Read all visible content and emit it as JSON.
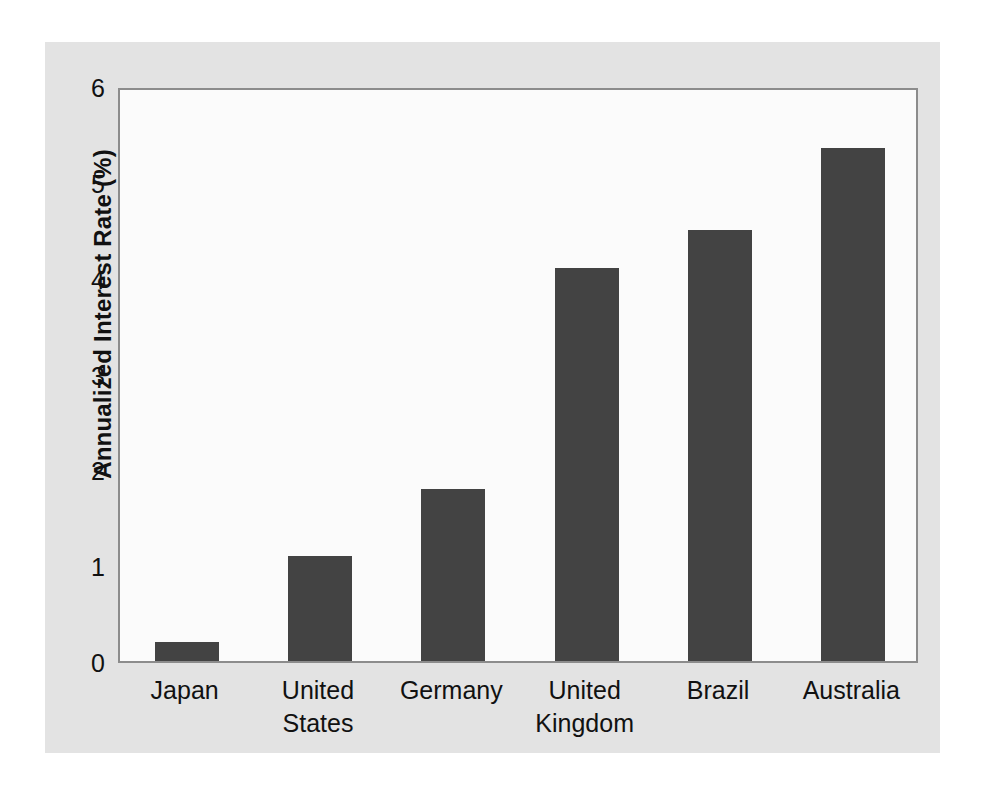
{
  "chart_data": {
    "type": "bar",
    "title": "",
    "subtitle": "",
    "xlabel": "",
    "ylabel": "Annualized Interest Rate (%)",
    "categories": [
      "Japan",
      "United States",
      "Germany",
      "United Kingdom",
      "Brazil",
      "Australia"
    ],
    "values": [
      0.2,
      1.1,
      1.8,
      4.1,
      4.5,
      5.35
    ],
    "ylim": [
      0,
      6
    ],
    "ytick_labels": [
      "0",
      "1",
      "2",
      "3",
      "4",
      "5",
      "6"
    ],
    "ytick_values": [
      0,
      1,
      2,
      3,
      4,
      5,
      6
    ],
    "grid": false,
    "legend": false,
    "legend_position": "none",
    "bar_color": "#434343",
    "plot_background": "#fbfbfb",
    "figure_background": "#e3e3e3",
    "axis_color": "#8c8c8c",
    "text_color": "#111111"
  },
  "axis": {
    "y_label": "Annualized Interest Rate (%)",
    "y_ticks": [
      "6",
      "5",
      "4",
      "3",
      "2",
      "1",
      "0"
    ],
    "x_categories": [
      {
        "label": "Japan",
        "lines": "Japan"
      },
      {
        "label": "United States",
        "lines": "United\nStates"
      },
      {
        "label": "Germany",
        "lines": "Germany"
      },
      {
        "label": "United Kingdom",
        "lines": "United\nKingdom"
      },
      {
        "label": "Brazil",
        "lines": "Brazil"
      },
      {
        "label": "Australia",
        "lines": "Australia"
      }
    ]
  }
}
